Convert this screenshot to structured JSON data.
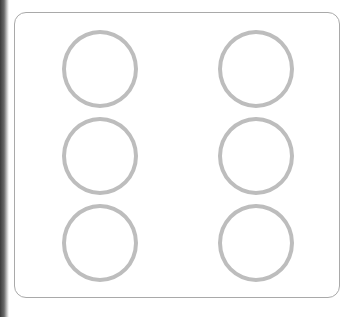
{
  "diagram": {
    "title": "",
    "card": {
      "border_color": "#a9a9a9",
      "corner_radius": 12
    },
    "grid": {
      "rows": 3,
      "columns": 2
    },
    "rings": [
      {
        "id": "ring-r1-c1",
        "row": 1,
        "col": 1,
        "cx": 100,
        "cy": 69
      },
      {
        "id": "ring-r1-c2",
        "row": 1,
        "col": 2,
        "cx": 256,
        "cy": 69
      },
      {
        "id": "ring-r2-c1",
        "row": 2,
        "col": 1,
        "cx": 100,
        "cy": 156
      },
      {
        "id": "ring-r2-c2",
        "row": 2,
        "col": 2,
        "cx": 256,
        "cy": 156
      },
      {
        "id": "ring-r3-c1",
        "row": 3,
        "col": 1,
        "cx": 100,
        "cy": 243
      },
      {
        "id": "ring-r3-c2",
        "row": 3,
        "col": 2,
        "cx": 256,
        "cy": 243
      }
    ],
    "ring_color": "#bdbdbd"
  }
}
